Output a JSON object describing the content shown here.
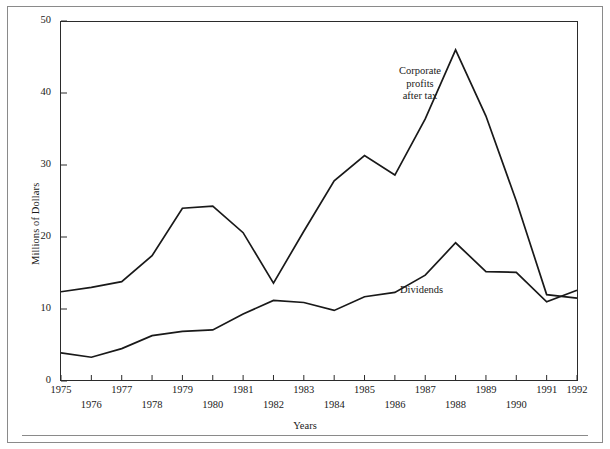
{
  "figure": {
    "y_axis_title": "Millions of Dollars",
    "x_axis_title": "Years"
  },
  "annotations": {
    "corporate": "Corporate\nprofits\nafter tax",
    "dividends": "Dividends"
  },
  "axes": {
    "y_ticks": [
      "0",
      "10",
      "20",
      "30",
      "40",
      "50"
    ],
    "x_ticks_top_row": [
      "1975",
      "1977",
      "1979",
      "1981",
      "1983",
      "1985",
      "1987",
      "1989",
      "1991",
      "1992"
    ],
    "x_ticks_bottom_row": [
      "1976",
      "1978",
      "1980",
      "1982",
      "1984",
      "1986",
      "1988",
      "1990"
    ]
  },
  "chart_data": {
    "type": "line",
    "title": "",
    "xlabel": "Years",
    "ylabel": "Millions of Dollars",
    "xlim": [
      1975,
      1992
    ],
    "ylim": [
      0,
      50
    ],
    "grid": false,
    "legend": "inline-annotations",
    "x": [
      1975,
      1976,
      1977,
      1978,
      1979,
      1980,
      1981,
      1982,
      1983,
      1984,
      1985,
      1986,
      1987,
      1988,
      1989,
      1990,
      1991,
      1992
    ],
    "series": [
      {
        "name": "Corporate profits after tax",
        "values": [
          12.4,
          13.0,
          13.8,
          17.4,
          24.0,
          24.3,
          20.6,
          13.6,
          20.8,
          27.8,
          31.3,
          28.6,
          36.4,
          46.0,
          36.8,
          25.0,
          12.0,
          11.5
        ]
      },
      {
        "name": "Dividends",
        "values": [
          3.9,
          3.3,
          4.5,
          6.3,
          6.9,
          7.1,
          9.3,
          11.2,
          10.9,
          9.8,
          11.7,
          12.3,
          14.7,
          19.2,
          15.2,
          15.1,
          11.0,
          12.6
        ]
      }
    ],
    "color": "#191919"
  }
}
